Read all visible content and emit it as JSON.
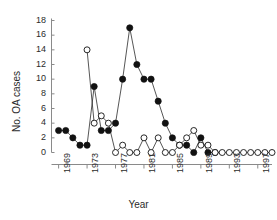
{
  "chart_data": {
    "type": "line",
    "title": "",
    "xlabel": "Year",
    "ylabel": "No. OA cases",
    "xlim": [
      1968,
      1999
    ],
    "ylim": [
      0,
      18
    ],
    "ytick_labels": [
      "0",
      "2",
      "4",
      "6",
      "8",
      "10",
      "12",
      "14",
      "16",
      "18"
    ],
    "ytick_values": [
      0,
      2,
      4,
      6,
      8,
      10,
      12,
      14,
      16,
      18
    ],
    "xtick_labels": [
      "1969",
      "1973",
      "1977",
      "1981",
      "1985",
      "1989",
      "1993",
      "1997"
    ],
    "xtick_values": [
      1969,
      1973,
      1977,
      1981,
      1985,
      1989,
      1993,
      1997
    ],
    "grid": false,
    "legend": "none",
    "x": [
      1969,
      1970,
      1971,
      1972,
      1973,
      1974,
      1975,
      1976,
      1977,
      1978,
      1979,
      1980,
      1981,
      1982,
      1983,
      1984,
      1985,
      1986,
      1987,
      1988,
      1989,
      1990,
      1991,
      1992,
      1993,
      1994,
      1995,
      1996,
      1997,
      1998,
      1999
    ],
    "series": [
      {
        "name": "filled-circles",
        "marker": "filled-circle",
        "color": "#111111",
        "x": [
          1969,
          1970,
          1971,
          1972,
          1973,
          1974,
          1975,
          1976,
          1977,
          1978,
          1979,
          1980,
          1981,
          1982,
          1983,
          1984,
          1985,
          1986,
          1987,
          1988,
          1989,
          1990,
          1991
        ],
        "values": [
          3,
          3,
          2,
          1,
          1,
          9,
          3,
          3,
          4,
          10,
          17,
          12,
          10,
          10,
          7,
          4,
          2,
          1,
          1,
          0,
          2,
          0,
          0
        ]
      },
      {
        "name": "open-circles",
        "marker": "open-circle",
        "color": "#ffffff",
        "x": [
          1973,
          1974,
          1975,
          1976,
          1977,
          1978,
          1979,
          1980,
          1981,
          1982,
          1983,
          1984,
          1985,
          1986,
          1987,
          1988,
          1989,
          1990,
          1991,
          1992,
          1993,
          1994,
          1995,
          1996,
          1997,
          1998,
          1999
        ],
        "values": [
          14,
          4,
          5,
          4,
          0,
          1,
          0,
          0,
          2,
          0,
          2,
          0,
          0,
          1,
          2,
          3,
          1,
          1,
          0,
          0,
          0,
          0,
          0,
          0,
          0,
          0,
          0
        ]
      }
    ]
  }
}
